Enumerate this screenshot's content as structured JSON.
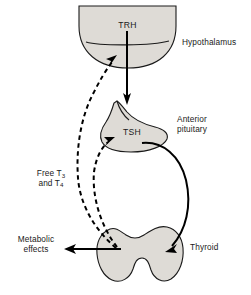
{
  "diagram": {
    "type": "flow-diagram",
    "background_color": "#ffffff",
    "organ_fill_color": "#dedbd6",
    "organ_stroke_color": "#1a1a1a",
    "arrow_color": "#000000"
  },
  "organs": [
    {
      "id": "hypothalamus",
      "label": "Hypothalamus",
      "shape": "semicircle-dome-down"
    },
    {
      "id": "anterior-pituitary",
      "label_line1": "Anterior",
      "label_line2": "pituitary",
      "shape": "pituitary-stalk-bulb"
    },
    {
      "id": "thyroid",
      "label": "Thyroid",
      "shape": "butterfly-bilobed"
    }
  ],
  "hormones": [
    {
      "id": "trh",
      "label": "TRH"
    },
    {
      "id": "tsh",
      "label": "TSH"
    }
  ],
  "feedback": {
    "label_line1": "Free T",
    "label_sub1": "3",
    "label_line2": "and T",
    "label_sub2": "4",
    "style": "dashed"
  },
  "outputs": {
    "metabolic_line1": "Metabolic",
    "metabolic_line2": "effects"
  },
  "arrows": [
    {
      "id": "trh-to-pituitary",
      "from": "hypothalamus",
      "to": "anterior-pituitary",
      "style": "solid-straight",
      "direction": "down"
    },
    {
      "id": "tsh-to-thyroid",
      "from": "anterior-pituitary",
      "to": "thyroid",
      "style": "solid-curved",
      "direction": "down-right-sweep"
    },
    {
      "id": "feedback-to-hypothalamus",
      "from": "thyroid",
      "to": "hypothalamus",
      "style": "dashed-curved",
      "direction": "up"
    },
    {
      "id": "feedback-to-pituitary",
      "from": "thyroid",
      "to": "anterior-pituitary",
      "style": "dashed-curved",
      "direction": "up"
    },
    {
      "id": "thyroid-to-metabolic",
      "from": "thyroid",
      "to": "metabolic-effects",
      "style": "solid-straight",
      "direction": "left"
    }
  ]
}
